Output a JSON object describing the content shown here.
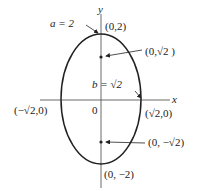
{
  "diagram": {
    "type": "ellipse",
    "axis_labels": {
      "x": "x",
      "y": "y"
    },
    "origin_label": "0",
    "annotations": {
      "a": "a = 2",
      "b": "b = √2"
    },
    "points": {
      "top_vertex": "(0,2)",
      "bottom_vertex": "(0, −2)",
      "left_covertex": "(−√2,0)",
      "right_covertex": "(√2,0)",
      "upper_focus": "(0,√2 )",
      "lower_focus": "(0, −√2)"
    },
    "colors": {
      "stroke": "#222222",
      "background": "#ffffff"
    }
  }
}
